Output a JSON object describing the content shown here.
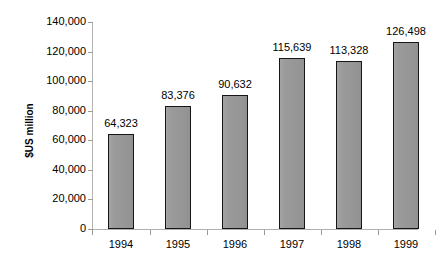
{
  "chart_data": {
    "type": "bar",
    "title": "",
    "subtitle": "",
    "xlabel": "",
    "ylabel": "$US million",
    "categories": [
      "1994",
      "1995",
      "1996",
      "1997",
      "1998",
      "1999"
    ],
    "values": [
      64323,
      83376,
      90632,
      115639,
      113328,
      126498
    ],
    "value_labels": [
      "64,323",
      "83,376",
      "90,632",
      "115,639",
      "113,328",
      "126,498"
    ],
    "ylim": [
      0,
      140000
    ],
    "ytick_values": [
      0,
      20000,
      40000,
      60000,
      80000,
      100000,
      120000,
      140000
    ],
    "ytick_labels": [
      "0",
      "20,000",
      "40,000",
      "60,000",
      "80,000",
      "100,000",
      "120,000",
      "140,000"
    ],
    "grid": false,
    "legend": null,
    "legend_position": "none",
    "series": [
      {
        "name": "",
        "values": [
          64323,
          83376,
          90632,
          115639,
          113328,
          126498
        ]
      }
    ],
    "colors": {
      "bar_fill": "#9a9a9a",
      "bar_border": "#161616",
      "axis": "#b0b0b0",
      "text": "#000000",
      "background": "#ffffff"
    }
  }
}
